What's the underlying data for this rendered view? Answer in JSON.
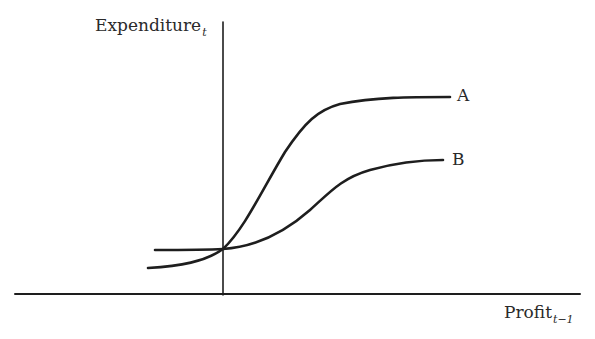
{
  "diagram": {
    "type": "line",
    "y_axis": {
      "label": "Expenditure",
      "subscript": "t"
    },
    "x_axis": {
      "label": "Profit",
      "subscript": "t−1"
    },
    "curves": [
      {
        "name": "A",
        "label": "A",
        "description": "Steep S-shaped curve, starts below B, crosses B at the vertical axis, rises sharply and plateaus higher"
      },
      {
        "name": "B",
        "label": "B",
        "description": "Flat at left, crosses A at the vertical axis, rises gently in an S-shape and plateaus lower"
      }
    ],
    "colors": {
      "ink": "#1e1e1e",
      "background": "#ffffff"
    }
  }
}
